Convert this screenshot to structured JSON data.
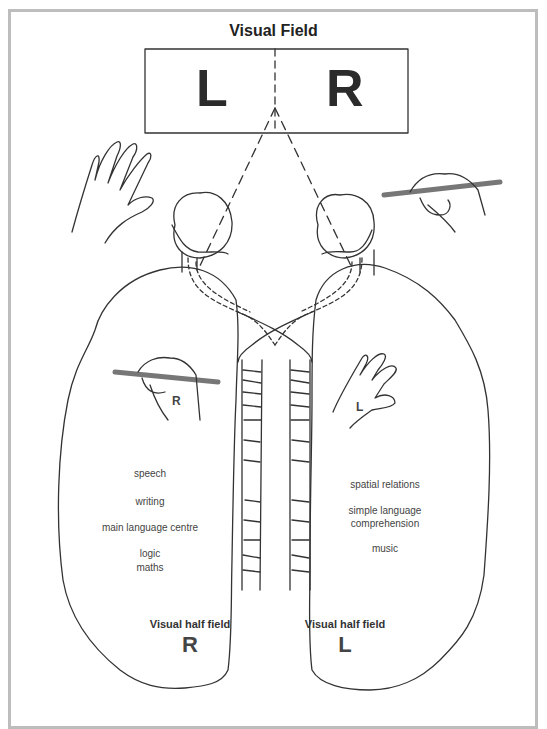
{
  "title": "Visual Field",
  "visual_field_box": {
    "left_letter": "L",
    "right_letter": "R"
  },
  "left_hemisphere": {
    "hand_label": "R",
    "functions": [
      "speech",
      "writing",
      "main language centre",
      "logic",
      "maths"
    ],
    "half_field_label": "Visual half field",
    "half_field_letter": "R"
  },
  "right_hemisphere": {
    "hand_label": "L",
    "functions": [
      "spatial relations",
      "simple language",
      "comprehension",
      "music"
    ],
    "half_field_label": "Visual half field",
    "half_field_letter": "L"
  },
  "colors": {
    "line": "#333333",
    "frame": "#bdbdbd",
    "pencil": "#8a8a8a",
    "text": "#333333"
  }
}
